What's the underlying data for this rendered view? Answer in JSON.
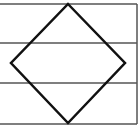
{
  "diagram": {
    "colors": {
      "background": "#ffffff",
      "frame_stroke": "#555555",
      "diamond_stroke": "#111111"
    },
    "frame": {
      "x": 0,
      "y": 4,
      "width": 137,
      "height": 120
    },
    "dividers": [
      43,
      83
    ],
    "diamond": {
      "top": [
        68,
        4
      ],
      "right": [
        125,
        63
      ],
      "bottom": [
        68,
        123
      ],
      "left": [
        11,
        63
      ]
    }
  }
}
